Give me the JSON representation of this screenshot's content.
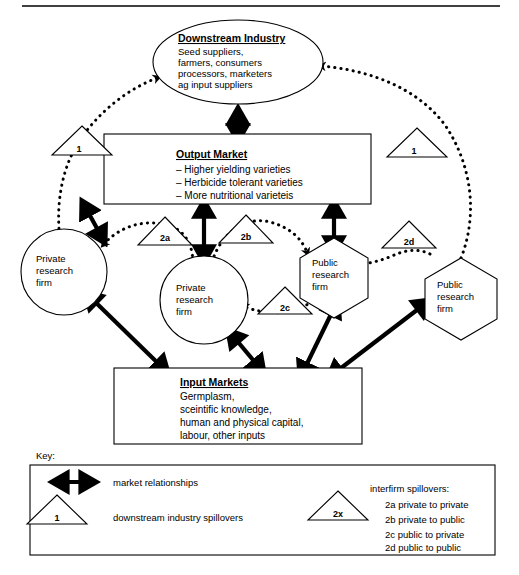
{
  "figure": {
    "nodes": {
      "downstream": {
        "title": "Downstream Industry",
        "lines": [
          "Seed suppliers,",
          "farmers, consumers",
          "processors, marketers",
          "ag input suppliers"
        ]
      },
      "output_market": {
        "title": "Output Market",
        "lines": [
          "– Higher yielding varieties",
          "– Herbicide tolerant varieties",
          "– More nutritional varieteis"
        ]
      },
      "input_markets": {
        "title": "Input Markets",
        "lines": [
          "Germplasm,",
          "sceintific knowledge,",
          "human and physical capital,",
          "labour, other inputs"
        ]
      },
      "private_firm_left": {
        "line1": "Private",
        "line2": "research",
        "line3": "firm"
      },
      "private_firm_center": {
        "line1": "Private",
        "line2": "research",
        "line3": "firm"
      },
      "public_firm_center": {
        "line1": "Public",
        "line2": "research",
        "line3": "firm"
      },
      "public_firm_right": {
        "line1": "Public",
        "line2": "research",
        "line3": "firm"
      }
    },
    "spillover_markers": {
      "downstream_left": "1",
      "downstream_right": "1",
      "interfirm_2a": "2a",
      "interfirm_2b": "2b",
      "interfirm_2c": "2c",
      "interfirm_2d": "2d"
    },
    "key": {
      "label": "Key:",
      "market_relationships": "market relationships",
      "downstream_triangle_label": "1",
      "downstream_spillovers": "downstream industry spillovers",
      "interfirm_triangle_label": "2x",
      "interfirm_heading": "interfirm spillovers:",
      "interfirm_items": [
        "2a private to private",
        "2b private to public",
        "2c public to private",
        "2d public to public"
      ]
    },
    "colors": {
      "stroke": "#000000",
      "background": "#ffffff"
    }
  }
}
